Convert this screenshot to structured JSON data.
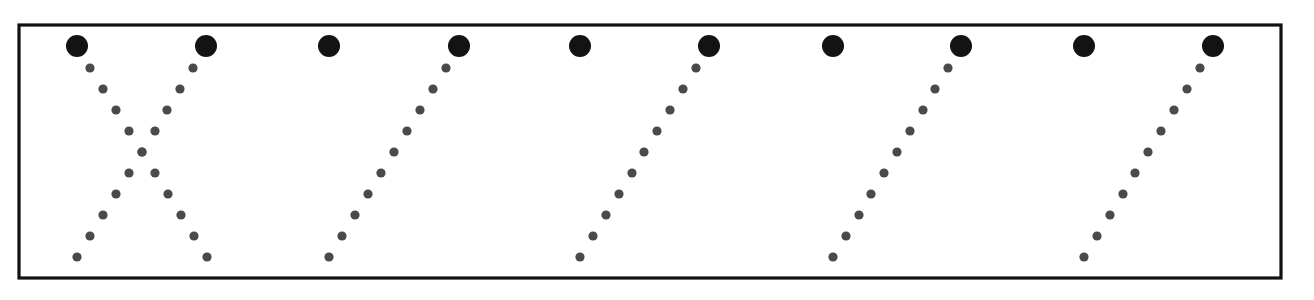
{
  "figure": {
    "title": "",
    "background_color": "#ffffff",
    "frame": {
      "x": 19,
      "y": 25,
      "width": 1262,
      "height": 253,
      "stroke_color": "#111111",
      "stroke_width": 3.2,
      "fill_color": "#ffffff"
    }
  },
  "chart_data": {
    "type": "scatter",
    "title": "",
    "subtitle": "",
    "xlabel": "",
    "ylabel": "",
    "xlim": [
      19,
      1281
    ],
    "ylim": [
      25,
      278
    ],
    "grid": false,
    "legend": null,
    "annotations": [],
    "axis_tick_labels": {
      "x": [],
      "y": []
    },
    "series": [
      {
        "name": "large-nodes",
        "marker": "filled-circle",
        "radius": 11,
        "color": "#131313",
        "points": [
          {
            "x": 77,
            "y": 46
          },
          {
            "x": 206,
            "y": 46
          },
          {
            "x": 329,
            "y": 46
          },
          {
            "x": 459,
            "y": 46
          },
          {
            "x": 580,
            "y": 46
          },
          {
            "x": 709,
            "y": 46
          },
          {
            "x": 833,
            "y": 46
          },
          {
            "x": 961,
            "y": 46
          },
          {
            "x": 1084,
            "y": 46
          },
          {
            "x": 1213,
            "y": 46
          }
        ]
      },
      {
        "name": "trail-1-down-right",
        "marker": "filled-circle",
        "radius": 4.6,
        "color": "#4a4a4a",
        "points": [
          {
            "x": 90,
            "y": 68
          },
          {
            "x": 103,
            "y": 89
          },
          {
            "x": 116,
            "y": 110
          },
          {
            "x": 129,
            "y": 131
          },
          {
            "x": 142,
            "y": 152
          },
          {
            "x": 155,
            "y": 173
          },
          {
            "x": 168,
            "y": 194
          },
          {
            "x": 181,
            "y": 215
          },
          {
            "x": 194,
            "y": 236
          },
          {
            "x": 207,
            "y": 257
          }
        ]
      },
      {
        "name": "trail-2-down-left",
        "marker": "filled-circle",
        "radius": 4.6,
        "color": "#4a4a4a",
        "points": [
          {
            "x": 193,
            "y": 68
          },
          {
            "x": 180,
            "y": 89
          },
          {
            "x": 167,
            "y": 110
          },
          {
            "x": 155,
            "y": 131
          },
          {
            "x": 142,
            "y": 152
          },
          {
            "x": 129,
            "y": 173
          },
          {
            "x": 116,
            "y": 194
          },
          {
            "x": 103,
            "y": 215
          },
          {
            "x": 90,
            "y": 236
          },
          {
            "x": 77,
            "y": 257
          }
        ]
      },
      {
        "name": "trail-3-down-left",
        "marker": "filled-circle",
        "radius": 4.6,
        "color": "#4a4a4a",
        "points": [
          {
            "x": 446,
            "y": 68
          },
          {
            "x": 433,
            "y": 89
          },
          {
            "x": 420,
            "y": 110
          },
          {
            "x": 407,
            "y": 131
          },
          {
            "x": 394,
            "y": 152
          },
          {
            "x": 381,
            "y": 173
          },
          {
            "x": 368,
            "y": 194
          },
          {
            "x": 355,
            "y": 215
          },
          {
            "x": 342,
            "y": 236
          },
          {
            "x": 329,
            "y": 257
          }
        ]
      },
      {
        "name": "trail-4-down-left",
        "marker": "filled-circle",
        "radius": 4.6,
        "color": "#4a4a4a",
        "points": [
          {
            "x": 696,
            "y": 68
          },
          {
            "x": 683,
            "y": 89
          },
          {
            "x": 670,
            "y": 110
          },
          {
            "x": 657,
            "y": 131
          },
          {
            "x": 644,
            "y": 152
          },
          {
            "x": 632,
            "y": 173
          },
          {
            "x": 619,
            "y": 194
          },
          {
            "x": 606,
            "y": 215
          },
          {
            "x": 593,
            "y": 236
          },
          {
            "x": 580,
            "y": 257
          }
        ]
      },
      {
        "name": "trail-5-down-left",
        "marker": "filled-circle",
        "radius": 4.6,
        "color": "#4a4a4a",
        "points": [
          {
            "x": 948,
            "y": 68
          },
          {
            "x": 935,
            "y": 89
          },
          {
            "x": 923,
            "y": 110
          },
          {
            "x": 910,
            "y": 131
          },
          {
            "x": 897,
            "y": 152
          },
          {
            "x": 884,
            "y": 173
          },
          {
            "x": 871,
            "y": 194
          },
          {
            "x": 859,
            "y": 215
          },
          {
            "x": 846,
            "y": 236
          },
          {
            "x": 833,
            "y": 257
          }
        ]
      },
      {
        "name": "trail-6-down-left",
        "marker": "filled-circle",
        "radius": 4.6,
        "color": "#4a4a4a",
        "points": [
          {
            "x": 1200,
            "y": 68
          },
          {
            "x": 1187,
            "y": 89
          },
          {
            "x": 1174,
            "y": 110
          },
          {
            "x": 1161,
            "y": 131
          },
          {
            "x": 1148,
            "y": 152
          },
          {
            "x": 1135,
            "y": 173
          },
          {
            "x": 1123,
            "y": 194
          },
          {
            "x": 1110,
            "y": 215
          },
          {
            "x": 1097,
            "y": 236
          },
          {
            "x": 1084,
            "y": 257
          }
        ]
      }
    ]
  }
}
